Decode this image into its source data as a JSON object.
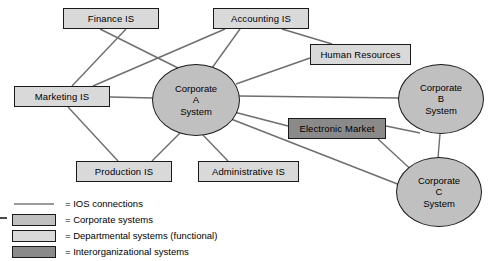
{
  "diagram": {
    "colors": {
      "corporate_fill": "#c0c0c0",
      "departmental_fill": "#d9d9d9",
      "ios_fill": "#8a8a8a",
      "stroke": "#1a1a1a",
      "connection_line": "#6e6e6e"
    },
    "nodes": [
      {
        "id": "finance",
        "label": "Finance IS",
        "type": "departmental",
        "shape": "box",
        "x": 63,
        "y": 8,
        "w": 96,
        "h": 21
      },
      {
        "id": "accounting",
        "label": "Accounting IS",
        "type": "departmental",
        "shape": "box",
        "x": 213,
        "y": 8,
        "w": 96,
        "h": 21
      },
      {
        "id": "human_resources",
        "label": "Human Resources",
        "type": "departmental",
        "shape": "box",
        "x": 310,
        "y": 44,
        "w": 101,
        "h": 21
      },
      {
        "id": "marketing",
        "label": "Marketing IS",
        "type": "departmental",
        "shape": "box",
        "x": 14,
        "y": 86,
        "w": 96,
        "h": 21
      },
      {
        "id": "production",
        "label": "Production IS",
        "type": "departmental",
        "shape": "box",
        "x": 76,
        "y": 161,
        "w": 96,
        "h": 21
      },
      {
        "id": "administrative",
        "label": "Administrative IS",
        "type": "departmental",
        "shape": "box",
        "x": 198,
        "y": 161,
        "w": 101,
        "h": 21
      },
      {
        "id": "electronic_market",
        "label": "Electronic Market",
        "type": "interorganizational",
        "shape": "box",
        "x": 288,
        "y": 118,
        "w": 98,
        "h": 21
      },
      {
        "id": "corporate_a",
        "label": "Corporate A System",
        "label_lines": [
          "Corporate",
          "A",
          "System"
        ],
        "type": "corporate",
        "shape": "circle",
        "x": 152,
        "y": 64,
        "w": 88,
        "h": 72
      },
      {
        "id": "corporate_b",
        "label": "Corporate B System",
        "label_lines": [
          "Corporate",
          "B",
          "System"
        ],
        "type": "corporate",
        "shape": "circle",
        "x": 398,
        "y": 64,
        "w": 86,
        "h": 70
      },
      {
        "id": "corporate_c",
        "label": "Corporate C System",
        "label_lines": [
          "Corporate",
          "C",
          "System"
        ],
        "type": "corporate",
        "shape": "circle",
        "x": 396,
        "y": 157,
        "w": 86,
        "h": 70
      }
    ],
    "connections": [
      {
        "from": "finance",
        "to": "corporate_a"
      },
      {
        "from": "finance",
        "to": "marketing"
      },
      {
        "from": "accounting",
        "to": "corporate_a"
      },
      {
        "from": "accounting",
        "to": "marketing"
      },
      {
        "from": "accounting",
        "to": "human_resources"
      },
      {
        "from": "human_resources",
        "to": "corporate_a"
      },
      {
        "from": "marketing",
        "to": "corporate_a"
      },
      {
        "from": "marketing",
        "to": "production"
      },
      {
        "from": "production",
        "to": "corporate_a"
      },
      {
        "from": "administrative",
        "to": "corporate_a"
      },
      {
        "from": "corporate_a",
        "to": "corporate_b"
      },
      {
        "from": "corporate_a",
        "to": "electronic_market"
      },
      {
        "from": "corporate_a",
        "to": "corporate_c"
      },
      {
        "from": "electronic_market",
        "to": "corporate_b"
      },
      {
        "from": "electronic_market",
        "to": "corporate_c"
      },
      {
        "from": "corporate_b",
        "to": "corporate_c"
      }
    ]
  },
  "legend": {
    "items": [
      {
        "key": "line",
        "label": "= IOS connections"
      },
      {
        "key": "corp",
        "label": "= Corporate systems"
      },
      {
        "key": "dept",
        "label": "= Departmental systems (functional)"
      },
      {
        "key": "ios",
        "label": "= Interorganizational systems"
      }
    ]
  }
}
